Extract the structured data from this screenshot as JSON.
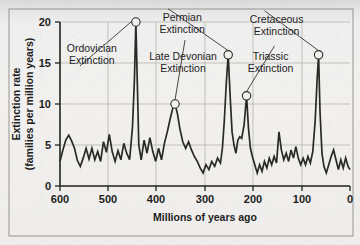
{
  "chart_data": {
    "type": "line",
    "title": "",
    "xlabel": "Millions of years ago",
    "ylabel": "Extinction rate (families per million years)",
    "xlim": [
      600,
      0
    ],
    "ylim": [
      0,
      20
    ],
    "x_ticks": [
      600,
      500,
      400,
      300,
      200,
      100,
      0
    ],
    "y_ticks": [
      0,
      5,
      10,
      15,
      20
    ],
    "x_axis_reversed": true,
    "grid": true,
    "legend": "none",
    "series": [
      {
        "name": "Extinction rate",
        "points": [
          [
            600,
            3.0
          ],
          [
            594,
            4.4
          ],
          [
            588,
            5.6
          ],
          [
            582,
            6.2
          ],
          [
            576,
            5.5
          ],
          [
            570,
            4.6
          ],
          [
            564,
            3.1
          ],
          [
            558,
            2.4
          ],
          [
            552,
            3.4
          ],
          [
            546,
            4.6
          ],
          [
            540,
            3.3
          ],
          [
            534,
            4.6
          ],
          [
            528,
            3.2
          ],
          [
            522,
            4.2
          ],
          [
            516,
            3.0
          ],
          [
            510,
            5.4
          ],
          [
            504,
            4.1
          ],
          [
            498,
            6.3
          ],
          [
            492,
            4.2
          ],
          [
            486,
            3.0
          ],
          [
            480,
            4.3
          ],
          [
            474,
            3.2
          ],
          [
            468,
            5.2
          ],
          [
            462,
            4.0
          ],
          [
            456,
            3.2
          ],
          [
            450,
            7.2
          ],
          [
            446,
            13.0
          ],
          [
            443,
            20.0
          ],
          [
            440,
            12.5
          ],
          [
            437,
            5.0
          ],
          [
            432,
            3.2
          ],
          [
            426,
            5.6
          ],
          [
            420,
            4.0
          ],
          [
            414,
            5.9
          ],
          [
            408,
            4.2
          ],
          [
            402,
            3.0
          ],
          [
            396,
            4.6
          ],
          [
            390,
            3.2
          ],
          [
            384,
            5.2
          ],
          [
            378,
            6.6
          ],
          [
            372,
            8.2
          ],
          [
            367,
            9.4
          ],
          [
            362,
            10.0
          ],
          [
            357,
            8.8
          ],
          [
            352,
            7.0
          ],
          [
            346,
            5.4
          ],
          [
            340,
            4.6
          ],
          [
            334,
            5.4
          ],
          [
            328,
            4.4
          ],
          [
            322,
            3.6
          ],
          [
            316,
            3.0
          ],
          [
            310,
            2.2
          ],
          [
            304,
            1.6
          ],
          [
            298,
            2.6
          ],
          [
            292,
            2.0
          ],
          [
            286,
            3.0
          ],
          [
            280,
            2.4
          ],
          [
            274,
            3.4
          ],
          [
            268,
            2.8
          ],
          [
            264,
            4.6
          ],
          [
            260,
            8.0
          ],
          [
            256,
            12.5
          ],
          [
            252,
            16.0
          ],
          [
            248,
            11.0
          ],
          [
            244,
            6.6
          ],
          [
            240,
            5.0
          ],
          [
            236,
            4.0
          ],
          [
            232,
            5.6
          ],
          [
            228,
            6.0
          ],
          [
            224,
            5.8
          ],
          [
            219,
            7.5
          ],
          [
            214,
            11.0
          ],
          [
            210,
            7.0
          ],
          [
            206,
            4.6
          ],
          [
            202,
            3.6
          ],
          [
            197,
            2.6
          ],
          [
            192,
            1.6
          ],
          [
            187,
            2.6
          ],
          [
            182,
            1.8
          ],
          [
            177,
            3.0
          ],
          [
            172,
            2.2
          ],
          [
            167,
            3.4
          ],
          [
            162,
            2.6
          ],
          [
            157,
            3.6
          ],
          [
            152,
            2.8
          ],
          [
            147,
            6.6
          ],
          [
            142,
            4.4
          ],
          [
            137,
            3.2
          ],
          [
            132,
            4.0
          ],
          [
            127,
            3.0
          ],
          [
            122,
            4.4
          ],
          [
            117,
            3.4
          ],
          [
            112,
            4.8
          ],
          [
            107,
            3.4
          ],
          [
            102,
            2.6
          ],
          [
            97,
            3.4
          ],
          [
            92,
            2.6
          ],
          [
            87,
            3.6
          ],
          [
            82,
            2.8
          ],
          [
            77,
            4.2
          ],
          [
            72,
            8.0
          ],
          [
            68,
            13.0
          ],
          [
            65,
            16.0
          ],
          [
            62,
            9.0
          ],
          [
            58,
            4.0
          ],
          [
            54,
            2.4
          ],
          [
            49,
            1.6
          ],
          [
            44,
            2.6
          ],
          [
            39,
            3.6
          ],
          [
            34,
            4.4
          ],
          [
            29,
            3.2
          ],
          [
            24,
            2.0
          ],
          [
            19,
            3.2
          ],
          [
            14,
            2.2
          ],
          [
            9,
            3.4
          ],
          [
            4,
            2.4
          ],
          [
            0,
            2.0
          ]
        ]
      }
    ],
    "annotations": [
      {
        "label_line1": "Ordovician",
        "label_line2": "Extinction",
        "x": 443,
        "y": 20.0
      },
      {
        "label_line1": "Late Devonian",
        "label_line2": "Extinction",
        "x": 362,
        "y": 10.0
      },
      {
        "label_line1": "Permian",
        "label_line2": "Extinction",
        "x": 252,
        "y": 16.0
      },
      {
        "label_line1": "Triassic",
        "label_line2": "Extinction",
        "x": 214,
        "y": 11.0
      },
      {
        "label_line1": "Cretaceous",
        "label_line2": "Extinction",
        "x": 65,
        "y": 16.0
      }
    ]
  },
  "axes": {
    "x_tick_labels": [
      "600",
      "500",
      "400",
      "300",
      "200",
      "100",
      "0"
    ],
    "y_tick_labels": [
      "20",
      "15",
      "10",
      "5",
      "0"
    ],
    "x_title": "Millions of years ago",
    "y_title_line1": "Extinction rate",
    "y_title_line2": "(families per million years)"
  },
  "colors": {
    "curve": "#2a2926",
    "axis": "#23221f",
    "grid": "#b9b7b3",
    "background": "#f1f0ee"
  }
}
